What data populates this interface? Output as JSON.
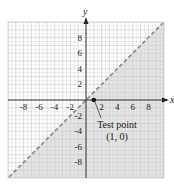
{
  "chart_data": {
    "type": "line",
    "title": "",
    "xlabel": "x",
    "ylabel": "y",
    "xlim": [
      -10,
      10
    ],
    "ylim": [
      -10,
      10
    ],
    "grid": true,
    "x_ticks": [
      "-8",
      "-6",
      "-4",
      "-2",
      "2",
      "4",
      "6",
      "8"
    ],
    "y_ticks": [
      "8",
      "6",
      "4",
      "2",
      "-2",
      "-4",
      "-6",
      "-8"
    ],
    "series": [
      {
        "name": "boundary line y = x",
        "style": "dashed",
        "x": [
          -10,
          10
        ],
        "y": [
          -10,
          10
        ]
      }
    ],
    "shaded_region": "below the line (y < x)",
    "annotations": [
      {
        "text_line1": "Test point",
        "text_line2": "(1, 0)",
        "point": [
          1,
          0
        ]
      }
    ]
  },
  "axes": {
    "x_label": "x",
    "y_label": "y"
  },
  "annotation": {
    "line1": "Test point",
    "line2": "(1, 0)"
  },
  "colors": {
    "shade": "#e4e4e4",
    "grid": "#c8c8c8",
    "axis": "#222222",
    "line": "#8a8a8a"
  }
}
